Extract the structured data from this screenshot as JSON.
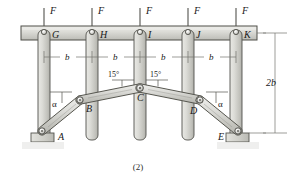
{
  "figure": {
    "caption": "(2)",
    "loads": [
      {
        "name": "load-F-1",
        "label": "F",
        "x": 44
      },
      {
        "name": "load-F-2",
        "label": "F",
        "x": 92
      },
      {
        "name": "load-F-3",
        "label": "F",
        "x": 140
      },
      {
        "name": "load-F-4",
        "label": "F",
        "x": 188
      },
      {
        "name": "load-F-5",
        "label": "F",
        "x": 236
      }
    ],
    "joint_labels": {
      "G": "G",
      "H": "H",
      "I": "I",
      "J": "J",
      "K": "K",
      "A": "A",
      "B": "B",
      "C": "C",
      "D": "D",
      "E": "E"
    },
    "dimensions": {
      "spans": [
        "b",
        "b",
        "b",
        "b"
      ],
      "height": "2b"
    },
    "angles": {
      "apex_left": "15°",
      "apex_right": "15°",
      "alpha_left": "α",
      "alpha_right": "α"
    },
    "colors": {
      "member_fill": "#d8d8d4",
      "member_stroke": "#55554f",
      "beam_fill": "#cfcfca",
      "ground_fill": "#cdcdc8",
      "line": "#3a3a36",
      "dim_line": "#6e6e68",
      "text": "#181818"
    }
  }
}
